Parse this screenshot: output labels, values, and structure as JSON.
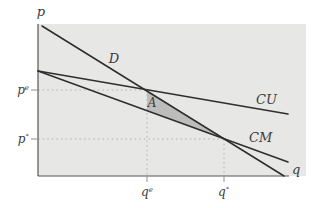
{
  "figure": {
    "width": 314,
    "height": 208,
    "colors": {
      "page_bg": "#ffffff",
      "plot_bg": "#e7e7e5",
      "curve": "#2e2e2e",
      "axis": "#565656",
      "dash": "#b4b4b4",
      "tick": "#8f8f8f",
      "triangle_fill": "#bdbdbb",
      "text": "#3a3a3a"
    }
  },
  "chart_data": {
    "type": "line",
    "title": "",
    "xlabel": "q",
    "ylabel": "p",
    "grid": false,
    "axis_style": "qualitative economics diagram, no numeric ticks",
    "plot_rect": {
      "x": 38,
      "y": 24,
      "w": 268,
      "h": 152
    },
    "axes": {
      "y_axis": {
        "x1": 38,
        "y1": 24,
        "x2": 38,
        "y2": 176
      },
      "x_axis": {
        "x1": 38,
        "y1": 176,
        "x2": 289,
        "y2": 176
      }
    },
    "curves": [
      {
        "label": "D",
        "px": [
          [
            42,
            26
          ],
          [
            284,
            176
          ]
        ]
      },
      {
        "label": "CU",
        "px": [
          [
            38,
            71
          ],
          [
            288,
            114
          ]
        ]
      },
      {
        "label": "CM",
        "px": [
          [
            38,
            71
          ],
          [
            288,
            162
          ]
        ]
      }
    ],
    "intersections": [
      {
        "curves": "D-CU",
        "px": [
          147,
          90
        ],
        "price_label": "pe",
        "quantity_label": "qe"
      },
      {
        "curves": "D-CM",
        "px": [
          224,
          139
        ],
        "price_label": "p°",
        "quantity_label": "q°"
      }
    ],
    "shaded_triangle": {
      "label": "A",
      "px": [
        [
          147,
          90
        ],
        [
          147,
          111
        ],
        [
          224,
          139
        ]
      ]
    },
    "guides": [
      {
        "name": "pe-dashed-line",
        "x1": 38,
        "y1": 90,
        "x2": 147,
        "y2": 90
      },
      {
        "name": "qe-dashed-line",
        "x1": 147,
        "y1": 90,
        "x2": 147,
        "y2": 176
      },
      {
        "name": "po-dashed-line",
        "x1": 38,
        "y1": 139,
        "x2": 224,
        "y2": 139
      },
      {
        "name": "qo-dashed-line",
        "x1": 224,
        "y1": 139,
        "x2": 224,
        "y2": 176
      }
    ],
    "ticks": [
      {
        "name": "pe-tick",
        "x1": 31,
        "y1": 90,
        "x2": 38,
        "y2": 90
      },
      {
        "name": "po-tick",
        "x1": 31,
        "y1": 139,
        "x2": 38,
        "y2": 139
      },
      {
        "name": "qe-tick",
        "x1": 147,
        "y1": 176,
        "x2": 147,
        "y2": 182
      },
      {
        "name": "qo-tick",
        "x1": 224,
        "y1": 176,
        "x2": 224,
        "y2": 182
      }
    ],
    "labels": [
      {
        "name": "y-axis-letter",
        "base": "p",
        "sup": "",
        "x": 41,
        "y": 16,
        "anchor": "middle",
        "size": 13
      },
      {
        "name": "x-axis-letter",
        "base": "q",
        "sup": "",
        "x": 292,
        "y": 174,
        "anchor": "start",
        "size": 13
      },
      {
        "name": "demand-curve-label",
        "base": "D",
        "sup": "",
        "x": 114,
        "y": 63,
        "anchor": "middle",
        "size": 13
      },
      {
        "name": "average-cost-curve-label",
        "base": "CU",
        "sup": "",
        "x": 256,
        "y": 104,
        "anchor": "start",
        "size": 13
      },
      {
        "name": "marginal-cost-curve-label",
        "base": "CM",
        "sup": "",
        "x": 249,
        "y": 142,
        "anchor": "start",
        "size": 13
      },
      {
        "name": "welfare-loss-area-label",
        "base": "A",
        "sup": "",
        "x": 152,
        "y": 107,
        "anchor": "middle",
        "size": 12
      },
      {
        "name": "pe-price-label",
        "base": "p",
        "sup": "e",
        "x": 29,
        "y": 94,
        "anchor": "end",
        "size": 12
      },
      {
        "name": "po-price-label",
        "base": "p",
        "sup": "°",
        "x": 29,
        "y": 143,
        "anchor": "end",
        "size": 12
      },
      {
        "name": "qe-quantity-label",
        "base": "q",
        "sup": "e",
        "x": 141,
        "y": 196,
        "anchor": "start",
        "size": 12
      },
      {
        "name": "qo-quantity-label",
        "base": "q",
        "sup": "°",
        "x": 218,
        "y": 196,
        "anchor": "start",
        "size": 12
      }
    ]
  }
}
